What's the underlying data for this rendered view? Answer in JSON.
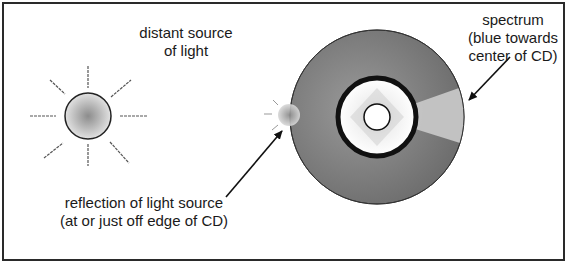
{
  "diagram": {
    "labels": {
      "source_line1": "distant source",
      "source_line2": "of light",
      "spectrum_line1": "spectrum",
      "spectrum_line2": "(blue towards",
      "spectrum_line3": "center of CD)",
      "reflection_line1": "reflection of light source",
      "reflection_line2": "(at or just off edge of CD)"
    },
    "elements": [
      {
        "name": "light-source",
        "shape": "circle with 8 rays"
      },
      {
        "name": "compact-disc",
        "shape": "disc with center hole"
      },
      {
        "name": "reflection",
        "shape": "small glowing circle at CD edge"
      },
      {
        "name": "spectrum-band",
        "shape": "lighter wedge on right side of CD"
      }
    ],
    "colors": {
      "frame": "#2a2a2a",
      "disc": "#8a8a8a",
      "spectrum": "#c4c4c4",
      "inner_ring": "#111111",
      "text": "#1a1a1a"
    }
  }
}
